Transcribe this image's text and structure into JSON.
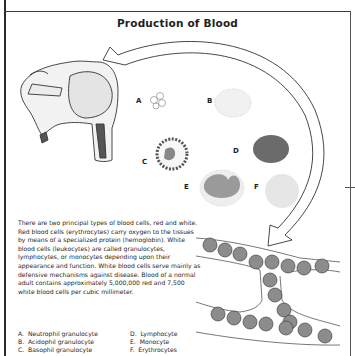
{
  "page": {
    "title": "Production of Blood",
    "paragraph": "There are two principal types of blood cells, red and white. Red blood cells (erythrocytes) carry oxygen to the tissues by means of a specialized protein (hemoglobin). White blood cells (leukocytes) are called granulocytes, lymphocytes, or monocytes depending upon their appearance and function. White blood cells serve mainly as defensive mechanisms against disease. Blood of a normal adult contains approximately 5,000,000 red and 7,500 white blood cells per cubic millimeter.",
    "cell_labels": [
      "A",
      "B",
      "C",
      "D",
      "E",
      "F"
    ],
    "legend": [
      {
        "key": "A.",
        "text": "Neutrophil granulocyte"
      },
      {
        "key": "D.",
        "text": "Lymphocyte"
      },
      {
        "key": "B.",
        "text": "Acidophil granulocyte"
      },
      {
        "key": "E.",
        "text": "Monocyte"
      },
      {
        "key": "C.",
        "text": "Basophil granulocyte"
      },
      {
        "key": "F.",
        "text": "Erythrocytes"
      }
    ]
  },
  "colors": {
    "lymphocyte": "#6b6b6b",
    "monocyte_nucleus": "#9a9a9a",
    "erythrocyte_light": "#e6e6e6",
    "rbc_in_vessel": "#8c8c8c"
  }
}
